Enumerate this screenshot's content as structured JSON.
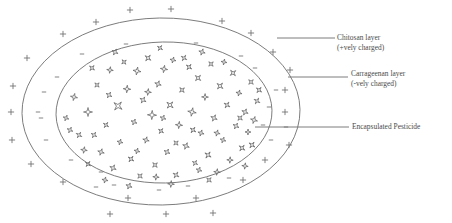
{
  "figure": {
    "background_color": "#ffffff",
    "stroke_color": "#6e6e6e",
    "text_color": "#4a4a4a"
  },
  "labels": {
    "chitosan": {
      "line1": "Chitosan layer",
      "line2": "(+vely charged)"
    },
    "carrageenan": {
      "line1": "Carrageenan layer",
      "line2": "(-vely charged)"
    },
    "pesticide": {
      "line1": "Encapsulated Pesticide"
    }
  },
  "diagram": {
    "outer_layer_name": "chitosan-outer-ellipse",
    "inner_layer_name": "carrageenan-inner-ellipse",
    "outer_charge_symbol": "+",
    "inner_charge_symbol": "-",
    "particle_symbol": "four-pointed-star",
    "outer_ellipse": {
      "cx": 161,
      "cy": 111.5,
      "rx": 139,
      "ry": 93.5
    },
    "inner_ellipse": {
      "cx": 164,
      "cy": 112.5,
      "rx": 108,
      "ry": 70.5
    },
    "plus_signs": [
      [
        130,
        10
      ],
      [
        171,
        9
      ],
      [
        96,
        22
      ],
      [
        222,
        21
      ],
      [
        63,
        34
      ],
      [
        251,
        33
      ],
      [
        27,
        58
      ],
      [
        273,
        52
      ],
      [
        11,
        112
      ],
      [
        290,
        70
      ],
      [
        285,
        112
      ],
      [
        289,
        145
      ],
      [
        31,
        164
      ],
      [
        265,
        160
      ],
      [
        63,
        182
      ],
      [
        243,
        180
      ],
      [
        128,
        198
      ],
      [
        196,
        198
      ],
      [
        110,
        214
      ],
      [
        166,
        214
      ],
      [
        213,
        213
      ],
      [
        13,
        86
      ],
      [
        12,
        140
      ],
      [
        285,
        90
      ]
    ],
    "minus_signs": [
      [
        126,
        44
      ],
      [
        196,
        43
      ],
      [
        241,
        56
      ],
      [
        57,
        77
      ],
      [
        276,
        90
      ],
      [
        38,
        112
      ],
      [
        41,
        118
      ],
      [
        271,
        140
      ],
      [
        101,
        172
      ],
      [
        159,
        190
      ],
      [
        229,
        178
      ],
      [
        71,
        160
      ],
      [
        286,
        127
      ],
      [
        82,
        54
      ],
      [
        255,
        68
      ],
      [
        263,
        125
      ],
      [
        114,
        185
      ],
      [
        188,
        186
      ],
      [
        46,
        140
      ],
      [
        269,
        107
      ],
      [
        96,
        187
      ],
      [
        44,
        92
      ]
    ],
    "particles": [
      [
        74,
        97,
        3.6,
        12
      ],
      [
        79,
        135,
        3.2,
        30
      ],
      [
        88,
        112,
        4.5,
        0
      ],
      [
        97,
        85,
        3.0,
        45
      ],
      [
        101,
        152,
        3.4,
        18
      ],
      [
        106,
        125,
        3.1,
        33
      ],
      [
        110,
        70,
        3.3,
        8
      ],
      [
        113,
        168,
        3.5,
        25
      ],
      [
        118,
        106,
        5.2,
        40
      ],
      [
        120,
        142,
        3.0,
        15
      ],
      [
        124,
        62,
        2.9,
        50
      ],
      [
        127,
        89,
        3.8,
        5
      ],
      [
        131,
        159,
        3.4,
        36
      ],
      [
        134,
        122,
        3.2,
        22
      ],
      [
        137,
        71,
        4.0,
        10
      ],
      [
        140,
        176,
        3.1,
        44
      ],
      [
        143,
        100,
        3.5,
        28
      ],
      [
        146,
        140,
        3.3,
        16
      ],
      [
        148,
        58,
        3.6,
        39
      ],
      [
        152,
        115,
        4.6,
        3
      ],
      [
        155,
        165,
        3.2,
        47
      ],
      [
        158,
        84,
        3.4,
        20
      ],
      [
        161,
        131,
        3.0,
        35
      ],
      [
        164,
        69,
        3.7,
        9
      ],
      [
        167,
        152,
        3.3,
        26
      ],
      [
        170,
        105,
        4.1,
        42
      ],
      [
        173,
        60,
        3.1,
        14
      ],
      [
        176,
        175,
        3.4,
        31
      ],
      [
        179,
        125,
        3.6,
        6
      ],
      [
        182,
        90,
        3.2,
        48
      ],
      [
        186,
        146,
        3.5,
        21
      ],
      [
        189,
        67,
        3.3,
        37
      ],
      [
        192,
        112,
        4.3,
        11
      ],
      [
        195,
        163,
        3.0,
        29
      ],
      [
        198,
        78,
        3.6,
        43
      ],
      [
        201,
        133,
        3.2,
        17
      ],
      [
        205,
        97,
        3.4,
        2
      ],
      [
        208,
        155,
        3.7,
        34
      ],
      [
        211,
        64,
        3.1,
        46
      ],
      [
        214,
        118,
        3.5,
        24
      ],
      [
        217,
        172,
        3.3,
        7
      ],
      [
        220,
        86,
        3.8,
        41
      ],
      [
        223,
        140,
        3.0,
        19
      ],
      [
        227,
        105,
        3.4,
        32
      ],
      [
        230,
        160,
        3.2,
        4
      ],
      [
        233,
        73,
        3.6,
        49
      ],
      [
        236,
        126,
        3.3,
        27
      ],
      [
        239,
        93,
        3.1,
        13
      ],
      [
        242,
        148,
        3.5,
        38
      ],
      [
        245,
        112,
        3.4,
        23
      ],
      [
        248,
        132,
        3.0,
        1
      ],
      [
        251,
        82,
        3.2,
        45
      ],
      [
        254,
        120,
        3.6,
        16
      ],
      [
        257,
        101,
        3.3,
        30
      ],
      [
        66,
        118,
        3.0,
        20
      ],
      [
        84,
        150,
        3.3,
        9
      ],
      [
        92,
        68,
        3.2,
        40
      ],
      [
        105,
        180,
        3.1,
        12
      ],
      [
        115,
        52,
        3.4,
        26
      ],
      [
        160,
        48,
        3.0,
        33
      ],
      [
        202,
        52,
        3.3,
        18
      ],
      [
        245,
        166,
        3.2,
        8
      ],
      [
        252,
        145,
        3.5,
        36
      ],
      [
        129,
        186,
        3.3,
        22
      ],
      [
        171,
        184,
        3.4,
        5
      ],
      [
        209,
        180,
        3.1,
        43
      ],
      [
        94,
        135,
        3.2,
        29
      ],
      [
        137,
        151,
        3.0,
        15
      ],
      [
        184,
        58,
        3.2,
        31
      ],
      [
        224,
        62,
        3.0,
        11
      ],
      [
        70,
        130,
        3.1,
        24
      ],
      [
        259,
        90,
        3.3,
        39
      ],
      [
        148,
        92,
        3.4,
        7
      ],
      [
        163,
        118,
        3.1,
        21
      ],
      [
        193,
        130,
        3.3,
        34
      ],
      [
        176,
        143,
        3.0,
        47
      ],
      [
        217,
        133,
        3.2,
        14
      ],
      [
        109,
        95,
        3.3,
        28
      ],
      [
        240,
        118,
        3.1,
        42
      ],
      [
        199,
        170,
        3.0,
        19
      ],
      [
        156,
        177,
        3.2,
        6
      ],
      [
        88,
        164,
        3.1,
        37
      ]
    ],
    "leader_lines": [
      {
        "name": "leader-chitosan",
        "x1": 277,
        "y1": 38,
        "x2": 335,
        "y2": 38
      },
      {
        "name": "leader-carrageenan",
        "x1": 288,
        "y1": 77,
        "x2": 348,
        "y2": 77
      },
      {
        "name": "leader-pesticide",
        "x1": 255,
        "y1": 127,
        "x2": 349,
        "y2": 127
      }
    ]
  }
}
